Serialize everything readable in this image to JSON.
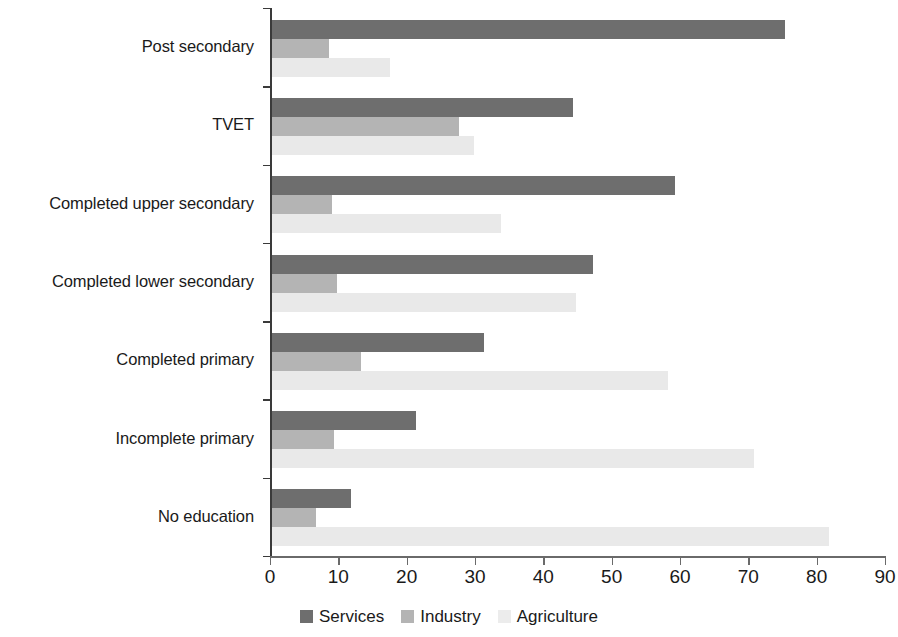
{
  "chart_data": {
    "type": "bar",
    "orientation": "horizontal",
    "title": "",
    "subtitle": "",
    "xlabel": "",
    "ylabel": "",
    "xlim": [
      0,
      90
    ],
    "xticks": [
      0,
      10,
      20,
      30,
      40,
      50,
      60,
      70,
      80,
      90
    ],
    "grid": false,
    "legend_position": "bottom-center",
    "categories": [
      "Post secondary",
      "TVET",
      "Completed upper secondary",
      "Completed lower secondary",
      "Completed primary",
      "Incomplete primary",
      "No education"
    ],
    "series": [
      {
        "name": "Services",
        "color": "#6e6e6e",
        "values": [
          75,
          44,
          59,
          47,
          31,
          21,
          11.5
        ]
      },
      {
        "name": "Industry",
        "color": "#b4b4b4",
        "values": [
          8.3,
          27.3,
          8.8,
          9.5,
          13,
          9,
          6.5
        ]
      },
      {
        "name": "Agriculture",
        "color": "#e9e9e9",
        "values": [
          17.3,
          29.5,
          33.5,
          44.5,
          58,
          70.5,
          81.5
        ]
      }
    ]
  },
  "legend": {
    "items": [
      {
        "label": "Services",
        "swatch": "services"
      },
      {
        "label": "Industry",
        "swatch": "industry"
      },
      {
        "label": "Agriculture",
        "swatch": "agriculture"
      }
    ]
  }
}
